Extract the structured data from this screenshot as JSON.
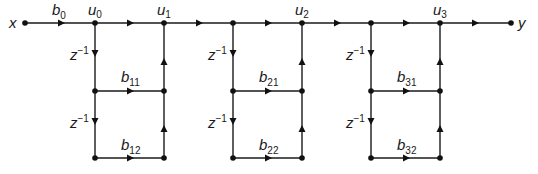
{
  "diagram": {
    "input_label": "x",
    "output_label": "y",
    "gain_b0": {
      "base": "b",
      "sub": "0"
    },
    "delay": {
      "base": "z",
      "sup": "−1"
    },
    "nodes": [
      {
        "base": "u",
        "sub": "0"
      },
      {
        "base": "u",
        "sub": "1"
      },
      {
        "base": "u",
        "sub": "2"
      },
      {
        "base": "u",
        "sub": "3"
      }
    ],
    "stages": [
      {
        "b1": {
          "base": "b",
          "sub": "11"
        },
        "b2": {
          "base": "b",
          "sub": "12"
        }
      },
      {
        "b1": {
          "base": "b",
          "sub": "21"
        },
        "b2": {
          "base": "b",
          "sub": "22"
        }
      },
      {
        "b1": {
          "base": "b",
          "sub": "31"
        },
        "b2": {
          "base": "b",
          "sub": "32"
        }
      }
    ],
    "colors": {
      "ink": "#1a1a1a",
      "background": "#ffffff"
    }
  }
}
